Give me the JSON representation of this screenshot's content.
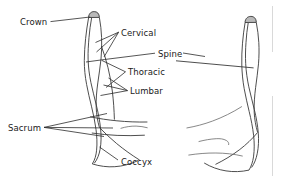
{
  "figure": {
    "background_color": "#ffffff",
    "stroke_color": "#3a3a3a",
    "text_color": "#1a1a1a",
    "crown_fill_color": "#b9b9b9"
  },
  "labels": [
    {
      "id": "crown",
      "text": "Crown",
      "x": 20,
      "y": 17
    },
    {
      "id": "cervical",
      "text": "Cervical",
      "x": 121,
      "y": 28
    },
    {
      "id": "spine",
      "text": "Spine",
      "x": 158,
      "y": 49
    },
    {
      "id": "thoracic",
      "text": "Thoracic",
      "x": 128,
      "y": 67
    },
    {
      "id": "lumbar",
      "text": "Lumbar",
      "x": 130,
      "y": 86
    },
    {
      "id": "sacrum",
      "text": "Sacrum",
      "x": 8,
      "y": 123
    },
    {
      "id": "coccyx",
      "text": "Coccyx",
      "x": 121,
      "y": 157
    }
  ]
}
